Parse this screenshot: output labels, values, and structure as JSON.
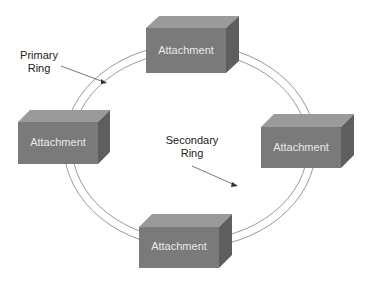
{
  "diagram": {
    "type": "ring topology",
    "labels": {
      "primary_ring": [
        "Primary",
        "Ring"
      ],
      "secondary_ring": [
        "Secondary",
        "Ring"
      ]
    },
    "nodes": [
      {
        "id": "top",
        "label": "Attachment"
      },
      {
        "id": "left",
        "label": "Attachment"
      },
      {
        "id": "right",
        "label": "Attachment"
      },
      {
        "id": "bottom",
        "label": "Attachment"
      }
    ],
    "colors": {
      "box_front": "#7a7a7a",
      "box_top": "#9a9a9a",
      "box_side": "#5e5e5e",
      "ring_stroke": "#9a9a9a",
      "text_on_box": "#e8e8e8",
      "label_text": "#222222"
    }
  }
}
